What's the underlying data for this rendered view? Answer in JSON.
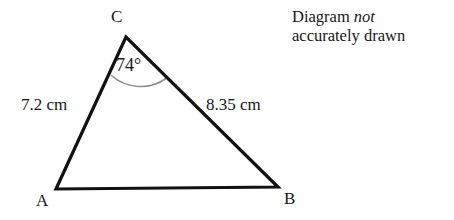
{
  "diagram": {
    "note": {
      "line1_prefix": "Diagram ",
      "line1_emphasis": "not",
      "line2": "accurately drawn"
    },
    "vertices": [
      {
        "name": "C",
        "label": "C",
        "x": 126,
        "y": 37
      },
      {
        "name": "A",
        "label": "A",
        "x": 56,
        "y": 189
      },
      {
        "name": "B",
        "label": "B",
        "x": 278,
        "y": 187
      }
    ],
    "sides": [
      {
        "name": "AC",
        "label": "7.2 cm",
        "value": 7.2,
        "unit": "cm"
      },
      {
        "name": "BC",
        "label": "8.35 cm",
        "value": 8.35,
        "unit": "cm"
      },
      {
        "name": "AB",
        "label": "",
        "value": null,
        "unit": ""
      }
    ],
    "angles": [
      {
        "at": "C",
        "label": "74°",
        "value": 74,
        "unit": "degrees"
      }
    ],
    "colors": {
      "stroke": "#111111",
      "arc": "#8f8f8f",
      "text": "#17171a",
      "background": "#ffffff"
    },
    "stroke_width": 3.2,
    "arc_stroke_width": 1.6
  }
}
